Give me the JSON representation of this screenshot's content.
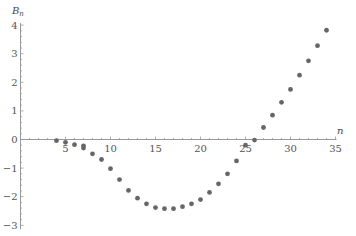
{
  "chart_data": {
    "type": "scatter",
    "title": "",
    "xlabel": "n",
    "ylabel": "B_n",
    "ylabel_main": "B",
    "ylabel_sub": "n",
    "xlim": [
      0,
      35
    ],
    "ylim": [
      -3,
      4
    ],
    "grid": false,
    "legend": null,
    "x_ticks": [
      5,
      10,
      15,
      20,
      25,
      30,
      35
    ],
    "x_tick_labels": [
      "5",
      "10",
      "15",
      "20",
      "25",
      "30",
      "35"
    ],
    "y_ticks": [
      -3,
      -2,
      -1,
      0,
      1,
      2,
      3,
      4
    ],
    "y_tick_labels": [
      "−3",
      "−2",
      "−1",
      "0",
      "1",
      "2",
      "3",
      "4"
    ],
    "marker_color": "#666666",
    "axis_color": "#999999",
    "series": [
      {
        "name": "B_n",
        "points": [
          [
            4,
            -0.04
          ],
          [
            5,
            -0.1
          ],
          [
            6,
            -0.18
          ],
          [
            7,
            -0.3
          ],
          [
            7,
            -0.22
          ],
          [
            8,
            -0.5
          ],
          [
            9,
            -0.7
          ],
          [
            10,
            -1.02
          ],
          [
            11,
            -1.4
          ],
          [
            12,
            -1.78
          ],
          [
            13,
            -2.05
          ],
          [
            14,
            -2.25
          ],
          [
            15,
            -2.38
          ],
          [
            16,
            -2.42
          ],
          [
            17,
            -2.42
          ],
          [
            18,
            -2.35
          ],
          [
            19,
            -2.25
          ],
          [
            20,
            -2.1
          ],
          [
            21,
            -1.85
          ],
          [
            22,
            -1.55
          ],
          [
            23,
            -1.2
          ],
          [
            24,
            -0.75
          ],
          [
            25,
            -0.2
          ],
          [
            26,
            -0.02
          ],
          [
            27,
            0.42
          ],
          [
            28,
            0.85
          ],
          [
            29,
            1.3
          ],
          [
            30,
            1.75
          ],
          [
            31,
            2.25
          ],
          [
            32,
            2.75
          ],
          [
            33,
            3.28
          ],
          [
            34,
            3.82
          ]
        ]
      }
    ]
  }
}
